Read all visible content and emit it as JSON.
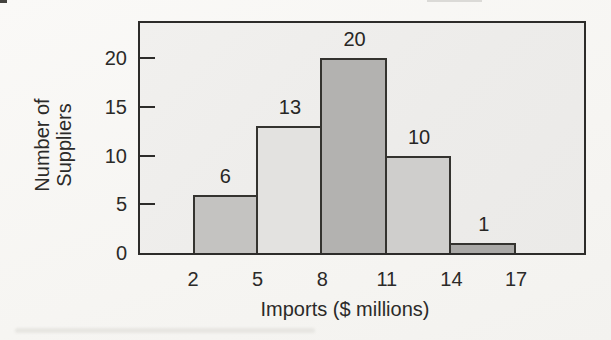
{
  "chart_data": {
    "type": "bar",
    "subtype": "histogram",
    "title": "",
    "xlabel": "Imports ($ millions)",
    "ylabel": "Number of Suppliers",
    "ylabel_lines": [
      "Number of",
      "Suppliers"
    ],
    "bin_edges": [
      2,
      5,
      8,
      11,
      14,
      17
    ],
    "bins": [
      [
        2,
        5
      ],
      [
        5,
        8
      ],
      [
        8,
        11
      ],
      [
        11,
        14
      ],
      [
        14,
        17
      ]
    ],
    "values": [
      6,
      13,
      20,
      10,
      1
    ],
    "data_labels": [
      "6",
      "13",
      "20",
      "10",
      "1"
    ],
    "x_ticks": [
      "2",
      "5",
      "8",
      "11",
      "14",
      "17"
    ],
    "y_ticks": [
      0,
      5,
      10,
      15,
      20
    ],
    "ylim": [
      0,
      23.6
    ],
    "grid": false,
    "legend": false,
    "bar_colors": [
      "#c4c3c1",
      "#e3e2e0",
      "#b3b2b0",
      "#cfcecc",
      "#a9a8a6"
    ],
    "bar_border_color": "#34332f",
    "plot_bg_color": "#edecea",
    "axis_color": "#2d2c2a",
    "text_color": "#2b2a28"
  }
}
